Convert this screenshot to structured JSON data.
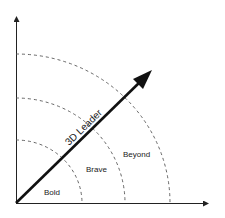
{
  "diagram": {
    "arrow_label": "3D Leader",
    "zones": [
      {
        "label": "Bold"
      },
      {
        "label": "Brave"
      },
      {
        "label": "Beyond"
      }
    ],
    "colors": {
      "axis": "#222222",
      "arc": "#555555",
      "arrow": "#111111",
      "text": "#222222"
    }
  }
}
